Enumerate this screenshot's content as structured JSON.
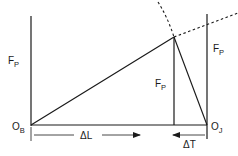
{
  "diagram": {
    "type": "joint-force-deformation-triangle",
    "labels": {
      "force_left": {
        "main": "F",
        "sub": "P"
      },
      "force_middle": {
        "main": "F",
        "sub": "P"
      },
      "force_right": {
        "main": "F",
        "sub": "P"
      },
      "origin_bolt": {
        "main": "O",
        "sub": "B"
      },
      "origin_joint": {
        "main": "O",
        "sub": "J"
      },
      "bolt_elongation": "ΔL",
      "joint_compression": "ΔT"
    },
    "colors": {
      "ink": "#1a1a1a",
      "background": "#ffffff"
    }
  }
}
